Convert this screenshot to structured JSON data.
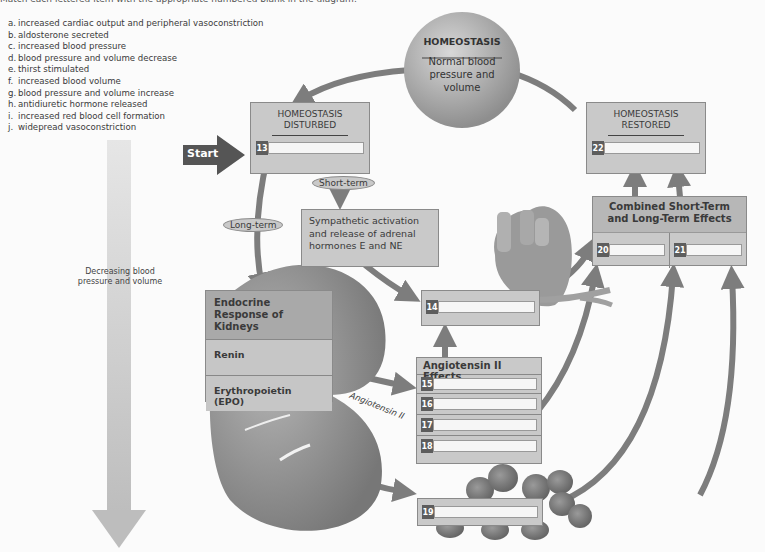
{
  "instruction": "Match each lettered item with the appropriate numbered blank in the diagram.",
  "legend": [
    {
      "key": "a.",
      "text": "increased cardiac output and peripheral vasoconstriction"
    },
    {
      "key": "b.",
      "text": "aldosterone secreted"
    },
    {
      "key": "c.",
      "text": "increased blood pressure"
    },
    {
      "key": "d.",
      "text": "blood pressure and volume decrease"
    },
    {
      "key": "e.",
      "text": "thirst stimulated"
    },
    {
      "key": "f.",
      "text": "increased blood volume"
    },
    {
      "key": "g.",
      "text": "blood pressure and volume increase"
    },
    {
      "key": "h.",
      "text": "antidiuretic hormone released"
    },
    {
      "key": "i.",
      "text": "increased red blood cell formation"
    },
    {
      "key": "j.",
      "text": "widepread vasoconstriction"
    }
  ],
  "homeostasis": {
    "title": "HOMEOSTASIS",
    "subtitle": "Normal blood pressure and volume"
  },
  "start_label": "Start",
  "disturbed": {
    "title": "HOMEOSTASIS DISTURBED",
    "blank": "13"
  },
  "restored": {
    "title": "HOMEOSTASIS RESTORED",
    "blank": "22"
  },
  "short_term": "Short-term",
  "long_term": "Long-term",
  "sympathetic": "Sympathetic activation and release of adrenal hormones E and NE",
  "decreasing": "Decreasing blood pressure and volume",
  "endocrine": {
    "title": "Endocrine Response of Kidneys",
    "rows": [
      "Renin",
      "Erythropoietin (EPO)"
    ]
  },
  "angiotensin_label": "Angiotensin II",
  "angiotensin_effects": {
    "title": "Angiotensin II Effects",
    "blanks": [
      "15",
      "16",
      "17",
      "18"
    ]
  },
  "heart_blank": "14",
  "rbc_blank": "19",
  "combined": {
    "title": "Combined Short-Term and Long-Term Effects",
    "blanks": [
      "20",
      "21"
    ]
  },
  "colors": {
    "box": "#c9c9c9",
    "arrow": "#7d7d7d",
    "numbox": "#5d5d5d",
    "start": "#555555"
  }
}
